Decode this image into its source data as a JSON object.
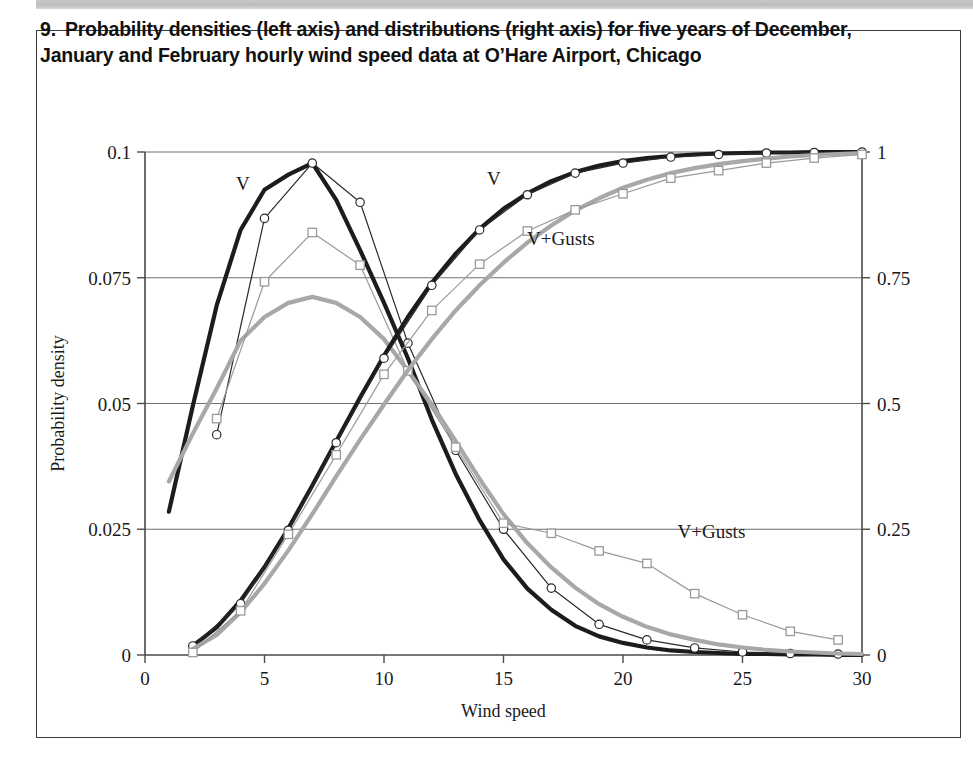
{
  "caption": {
    "number": "9.",
    "text": "Probability densities (left axis) and distributions (right axis) for five years of December, January and February hourly wind speed data at O’Hare Airport, Chicago"
  },
  "chart_data": {
    "type": "line",
    "title": "Probability densities (left axis) and distributions (right axis) for five years of December, January and February hourly wind speed data at O’Hare Airport, Chicago",
    "xlabel": "Wind speed",
    "ylabel": "Probability density",
    "ylabel_right": "",
    "xlim": [
      0,
      30
    ],
    "ylim": [
      0,
      0.1
    ],
    "ylim_right": [
      0,
      1
    ],
    "xticks": [
      0,
      5,
      10,
      15,
      20,
      25,
      30
    ],
    "xtick_labels": [
      "0",
      "5",
      "10",
      "15",
      "20",
      "25",
      "30"
    ],
    "yticks": [
      0,
      0.025,
      0.05,
      0.075,
      0.1
    ],
    "ytick_labels": [
      "0",
      "0.025",
      "0.05",
      "0.075",
      "0.1"
    ],
    "yticks_right": [
      0,
      0.25,
      0.5,
      0.75,
      1
    ],
    "ytick_labels_right": [
      "0",
      "0.25",
      "0.5",
      "0.75",
      "1"
    ],
    "grid": true,
    "grid_axis": "y",
    "legend_position": "inline-annotations",
    "annotations": [
      {
        "text": "V",
        "x": 4.1,
        "y_left": 0.0925,
        "axis": "left"
      },
      {
        "text": "V",
        "x": 14.6,
        "y_right": 0.935,
        "axis": "right"
      },
      {
        "text": "V+Gusts",
        "x": 17.4,
        "y_right": 0.815,
        "axis": "right"
      },
      {
        "text": "V+Gusts",
        "x": 23.7,
        "y_left": 0.0232,
        "axis": "left"
      }
    ],
    "series": [
      {
        "name": "V density (fitted)",
        "axis": "left",
        "style": "thick-line",
        "color": "#1c1c1c",
        "marker": "none",
        "x": [
          1,
          2,
          3,
          4,
          5,
          6,
          7,
          8,
          9,
          10,
          11,
          12,
          13,
          14,
          15,
          16,
          17,
          18,
          19,
          20,
          21,
          22,
          23,
          24,
          25,
          26,
          27,
          28,
          29,
          30
        ],
        "values": [
          0.0285,
          0.0495,
          0.0695,
          0.0845,
          0.0925,
          0.0955,
          0.0978,
          0.0905,
          0.0805,
          0.07,
          0.059,
          0.0468,
          0.036,
          0.0268,
          0.019,
          0.0132,
          0.009,
          0.0058,
          0.0037,
          0.0024,
          0.0015,
          0.0009,
          0.0006,
          0.0004,
          0.0002,
          0.0002,
          0.0001,
          0.0001,
          0.0,
          0.0
        ]
      },
      {
        "name": "V density (data)",
        "axis": "left",
        "style": "thin-line-marker",
        "color": "#2a2a2a",
        "marker": "circle",
        "x": [
          3,
          5,
          7,
          9,
          11,
          13,
          15,
          17,
          19,
          21,
          23,
          25,
          27,
          29
        ],
        "values": [
          0.0438,
          0.0868,
          0.0978,
          0.09,
          0.062,
          0.0407,
          0.025,
          0.0133,
          0.0061,
          0.003,
          0.0014,
          0.0006,
          0.0003,
          0.0002
        ]
      },
      {
        "name": "V+Gusts density (fitted)",
        "axis": "left",
        "style": "thick-line",
        "color": "#a8a8a8",
        "marker": "none",
        "x": [
          1,
          2,
          3,
          4,
          5,
          6,
          7,
          8,
          9,
          10,
          11,
          12,
          13,
          14,
          15,
          16,
          17,
          18,
          19,
          20,
          21,
          22,
          23,
          24,
          25,
          26,
          27,
          28,
          29,
          30
        ],
        "values": [
          0.0345,
          0.044,
          0.053,
          0.0625,
          0.0672,
          0.07,
          0.0712,
          0.07,
          0.0672,
          0.0628,
          0.0565,
          0.0498,
          0.0425,
          0.035,
          0.028,
          0.0222,
          0.0174,
          0.0134,
          0.0101,
          0.0076,
          0.0056,
          0.0041,
          0.003,
          0.0021,
          0.0015,
          0.001,
          0.0007,
          0.0005,
          0.0003,
          0.0002
        ]
      },
      {
        "name": "V+Gusts density (data)",
        "axis": "left",
        "style": "thin-line-marker",
        "color": "#9a9a9a",
        "marker": "square",
        "x": [
          3,
          5,
          7,
          9,
          11,
          13,
          15,
          17,
          19,
          21,
          23,
          25,
          27,
          29
        ],
        "values": [
          0.047,
          0.0742,
          0.084,
          0.0775,
          0.0565,
          0.0413,
          0.0262,
          0.0242,
          0.0207,
          0.0182,
          0.0122,
          0.008,
          0.0047,
          0.003
        ]
      },
      {
        "name": "V distribution (fitted)",
        "axis": "right",
        "style": "thick-line",
        "color": "#1c1c1c",
        "marker": "none",
        "x": [
          2,
          3,
          4,
          5,
          6,
          7,
          8,
          9,
          10,
          11,
          12,
          13,
          14,
          15,
          16,
          17,
          18,
          19,
          20,
          21,
          22,
          23,
          24,
          25,
          26,
          27,
          28,
          29,
          30
        ],
        "values": [
          0.018,
          0.055,
          0.108,
          0.175,
          0.252,
          0.337,
          0.425,
          0.512,
          0.595,
          0.672,
          0.74,
          0.798,
          0.847,
          0.887,
          0.918,
          0.942,
          0.96,
          0.973,
          0.982,
          0.988,
          0.992,
          0.995,
          0.997,
          0.998,
          0.999,
          0.999,
          1.0,
          1.0,
          1.0
        ]
      },
      {
        "name": "V distribution (data)",
        "axis": "right",
        "style": "thin-line-marker",
        "color": "#2a2a2a",
        "marker": "circle",
        "x": [
          2,
          4,
          6,
          8,
          10,
          12,
          14,
          16,
          18,
          20,
          22,
          24,
          26,
          28,
          30
        ],
        "values": [
          0.018,
          0.102,
          0.248,
          0.422,
          0.59,
          0.735,
          0.845,
          0.915,
          0.958,
          0.978,
          0.99,
          0.995,
          0.998,
          0.999,
          1.0
        ]
      },
      {
        "name": "V+Gusts distribution (fitted)",
        "axis": "right",
        "style": "thick-line",
        "color": "#a8a8a8",
        "marker": "none",
        "x": [
          2,
          3,
          4,
          5,
          6,
          7,
          8,
          9,
          10,
          11,
          12,
          13,
          14,
          15,
          16,
          17,
          18,
          19,
          20,
          21,
          22,
          23,
          24,
          25,
          26,
          27,
          28,
          29,
          30
        ],
        "values": [
          0.012,
          0.04,
          0.085,
          0.142,
          0.208,
          0.28,
          0.355,
          0.428,
          0.498,
          0.566,
          0.628,
          0.685,
          0.735,
          0.78,
          0.82,
          0.854,
          0.884,
          0.908,
          0.929,
          0.945,
          0.958,
          0.968,
          0.976,
          0.982,
          0.987,
          0.991,
          0.994,
          0.996,
          0.998
        ]
      },
      {
        "name": "V+Gusts distribution (data)",
        "axis": "right",
        "style": "thin-line-marker",
        "color": "#9a9a9a",
        "marker": "square",
        "x": [
          2,
          4,
          6,
          8,
          10,
          12,
          14,
          16,
          18,
          20,
          22,
          24,
          26,
          28,
          30
        ],
        "values": [
          0.005,
          0.088,
          0.24,
          0.398,
          0.558,
          0.685,
          0.777,
          0.843,
          0.885,
          0.917,
          0.948,
          0.963,
          0.978,
          0.988,
          0.995
        ]
      }
    ]
  }
}
